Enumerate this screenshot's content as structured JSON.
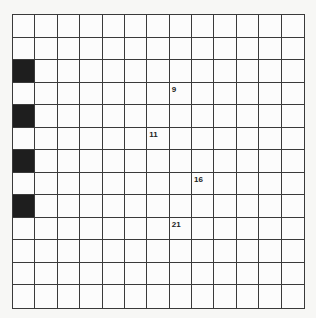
{
  "puzzle": {
    "rows": 13,
    "cols": 13,
    "black_cells": [
      [
        2,
        0
      ],
      [
        4,
        0
      ],
      [
        6,
        0
      ],
      [
        8,
        0
      ]
    ],
    "clue_numbers": [
      {
        "row": 3,
        "col": 7,
        "label": "9"
      },
      {
        "row": 5,
        "col": 6,
        "label": "11"
      },
      {
        "row": 7,
        "col": 8,
        "label": "16"
      },
      {
        "row": 9,
        "col": 7,
        "label": "21"
      }
    ]
  },
  "colors": {
    "grid_line": "#3a3a3a",
    "black_cell": "#1e1e1e",
    "white_cell": "#fcfcfc"
  }
}
